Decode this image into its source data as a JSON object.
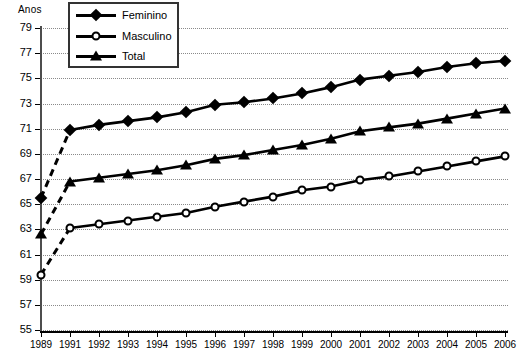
{
  "chart_data": {
    "type": "line",
    "title": "",
    "ylabel": "Anos",
    "xlabel": "",
    "ylim": [
      55,
      79
    ],
    "ytick_step": 2,
    "yticks": [
      55,
      57,
      59,
      61,
      63,
      65,
      67,
      69,
      71,
      73,
      75,
      77,
      79
    ],
    "grid": true,
    "legend_position": "top-left",
    "categories": [
      "1989",
      "1991",
      "1992",
      "1993",
      "1994",
      "1995",
      "1996",
      "1997",
      "1998",
      "1999",
      "2000",
      "2001",
      "2002",
      "2003",
      "2004",
      "2005",
      "2006"
    ],
    "gap_after_index": 0,
    "series": [
      {
        "name": "Feminino",
        "marker": "filled-diamond",
        "color": "#000000",
        "values": [
          65.5,
          70.9,
          71.3,
          71.6,
          71.9,
          72.3,
          72.9,
          73.1,
          73.4,
          73.8,
          74.3,
          74.9,
          75.2,
          75.5,
          75.9,
          76.2,
          76.4
        ]
      },
      {
        "name": "Masculino",
        "marker": "open-circle",
        "color": "#000000",
        "values": [
          59.4,
          63.1,
          63.4,
          63.7,
          64.0,
          64.3,
          64.8,
          65.2,
          65.6,
          66.1,
          66.4,
          66.9,
          67.2,
          67.6,
          68.0,
          68.4,
          68.8
        ]
      },
      {
        "name": "Total",
        "marker": "filled-triangle",
        "color": "#000000",
        "values": [
          62.6,
          66.8,
          67.1,
          67.4,
          67.7,
          68.1,
          68.6,
          68.9,
          69.3,
          69.7,
          70.2,
          70.8,
          71.1,
          71.4,
          71.8,
          72.2,
          72.6
        ]
      }
    ]
  },
  "legend": {
    "items": [
      {
        "label": "Feminino",
        "marker": "filled-diamond"
      },
      {
        "label": "Masculino",
        "marker": "open-circle"
      },
      {
        "label": "Total",
        "marker": "filled-triangle"
      }
    ]
  },
  "axis": {
    "unit_label": "Anos"
  }
}
